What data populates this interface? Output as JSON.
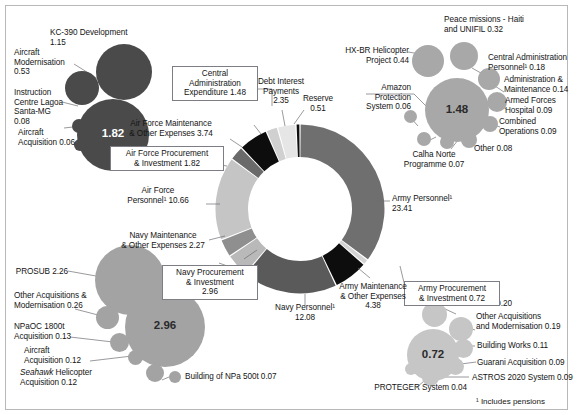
{
  "figure": {
    "footnote": "¹ Includes pensions",
    "center_blank": true
  },
  "chart_data": {
    "type": "pie",
    "title": "",
    "unit": "R$ billion",
    "legend_position": "annotations",
    "total": 65.62,
    "categories": [
      "Army Personnel¹",
      "Army Procurement & Investment",
      "Army Maintenance & Other Expenses",
      "Navy Personnel¹",
      "Navy Procurement & Investment",
      "Navy Maintenance & Other Expenses",
      "Air Force Personnel¹",
      "Air Force Procurement & Investment",
      "Air Force Maintenance & Other Expenses",
      "Central Administration Expenditure",
      "Debt Interest Payments",
      "Reserve"
    ],
    "values": [
      23.41,
      0.72,
      4.38,
      12.08,
      2.96,
      2.27,
      10.66,
      1.82,
      3.74,
      1.48,
      2.35,
      0.51
    ],
    "colors": [
      "#6f6f6f",
      "#d4d4d4",
      "#0d0d0d",
      "#5a5a5a",
      "#b9b9b9",
      "#8f8f8f",
      "#c5c5c5",
      "#6a6a6a",
      "#0d0d0d",
      "#d0d0d0",
      "#e6e6e6",
      "#111111"
    ],
    "breakdowns": [
      {
        "parent": "Air Force Procurement & Investment",
        "parent_value": "1.82",
        "children": [
          {
            "label": "KC-390 Development",
            "value": "1.15"
          },
          {
            "label": "Aircraft Modernisation",
            "value": "0.53"
          },
          {
            "label": "Instruction Centre Lagoa Santa-MG",
            "value": "0.08"
          },
          {
            "label": "Aircraft Acquisition",
            "value": "0.06"
          }
        ]
      },
      {
        "parent": "Central Administration Expenditure",
        "parent_value": "1.48",
        "children": [
          {
            "label": "HX-BR Helicopter Project",
            "value": "0.44"
          },
          {
            "label": "Peace missions - Haiti and UNIFIL",
            "value": "0.32"
          },
          {
            "label": "Central Administration Personnel¹",
            "value": "0.18"
          },
          {
            "label": "Administration & Maintenance",
            "value": "0.14"
          },
          {
            "label": "Armed Forces Hospital",
            "value": "0.09"
          },
          {
            "label": "Combined Operations",
            "value": "0.09"
          },
          {
            "label": "Other",
            "value": "0.08"
          },
          {
            "label": "Calha Norte Programme",
            "value": "0.07"
          },
          {
            "label": "Amazon Protection System",
            "value": "0.06"
          }
        ]
      },
      {
        "parent": "Navy Procurement & Investment",
        "parent_value": "2.96",
        "children": [
          {
            "label": "PROSUB",
            "value": "2.26"
          },
          {
            "label": "Other Acquisitions & Modernisation",
            "value": "0.26"
          },
          {
            "label": "NPaOC 1800t Acquisition",
            "value": "0.13"
          },
          {
            "label": "Aircraft Acquisition",
            "value": "0.12"
          },
          {
            "label": "Seahawk Helicopter Acquisition",
            "value": "0.12"
          },
          {
            "label": "Building of NPa 500t",
            "value": "0.07"
          }
        ]
      },
      {
        "parent": "Army Procurement & Investment",
        "parent_value": "0.72",
        "children": [
          {
            "label": "SISFRON",
            "value": "0.20"
          },
          {
            "label": "Other Acquisitions and Modernisation",
            "value": "0.19"
          },
          {
            "label": "Building Works",
            "value": "0.11"
          },
          {
            "label": "Guarani Acquisition",
            "value": "0.09"
          },
          {
            "label": "ASTROS 2020 System",
            "value": "0.09"
          },
          {
            "label": "PROTEGER System",
            "value": "0.04"
          }
        ]
      }
    ]
  },
  "donut_labels": {
    "army_personnel": "Army Personnel¹\n23.41",
    "army_procurement": "Army Procurement\n& Investment  0.72",
    "army_maintenance": "Army Maintenance\n& Other Expenses\n4.38",
    "navy_personnel": "Navy Personnel¹\n12.08",
    "navy_procurement": "Navy Procurement\n& Investment\n2.96",
    "navy_maintenance": "Navy Maintenance\n& Other Expenses  2.27",
    "af_personnel": "Air Force\nPersonnel¹  10.66",
    "af_procurement": "Air Force Procurement\n& Investment  1.82",
    "af_maintenance": "Air Force Maintenance\n& Other Expenses  3.74",
    "central_admin": "Central\nAdministration\nExpenditure  1.48",
    "debt_interest": "Debt Interest\nPayments\n2.35",
    "reserve": "Reserve\n0.51"
  },
  "af_cluster": {
    "main_value": "1.82",
    "kc390": "KC-390 Development\n1.15",
    "modernisation": "Aircraft\nModernisation\n0.53",
    "instruction": "Instruction\nCentre Lagoa\nSanta-MG\n0.08",
    "acquisition": "Aircraft\nAcquisition  0.06"
  },
  "ca_cluster": {
    "main_value": "1.48",
    "hxbr": "HX-BR Helicopter\nProject  0.44",
    "peace": "Peace missions - Haiti\nand UNIFIL  0.32",
    "personnel": "Central Administration\nPersonnel¹  0.18",
    "admin_maint": "Administration &\nMaintenance  0.14",
    "hospital": "Armed Forces\nHospital  0.09",
    "combined": "Combined\nOperations  0.09",
    "other": "Other  0.08",
    "calha": "Calha Norte\nProgramme  0.07",
    "amazon": "Amazon\nProtection\nSystem  0.06"
  },
  "navy_cluster": {
    "main_value": "2.96",
    "prosub": "PROSUB  2.26",
    "other_acq": "Other Acquisitions &\nModernisation  0.26",
    "npaoc": "NPaOC 1800t\nAcquisition  0.13",
    "aircraft": "Aircraft\nAcquisition  0.12",
    "seahawk_italic": "Seahawk",
    "seahawk_rest": " Helicopter\nAcquisition  0.12",
    "npa500": "Building of NPa 500t  0.07"
  },
  "army_cluster": {
    "main_value": "0.72",
    "sisfron": "SISFRON  0.20",
    "other_acq": "Other Acquisitions\nand Modernisation  0.19",
    "building": "Building Works  0.11",
    "guarani": "Guarani Acquisition  0.09",
    "astros": "ASTROS 2020 System  0.09",
    "proteger": "PROTEGER System  0.04"
  }
}
